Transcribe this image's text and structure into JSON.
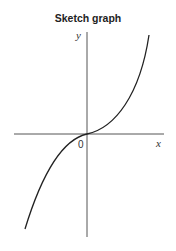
{
  "title": "Sketch graph",
  "axes": {
    "x_label": "x",
    "y_label": "y",
    "origin_label": "0"
  },
  "curve": {
    "description": "cubic-like curve through origin, increasing, flat at origin",
    "color": "#222222"
  },
  "axis_color": "#555555"
}
